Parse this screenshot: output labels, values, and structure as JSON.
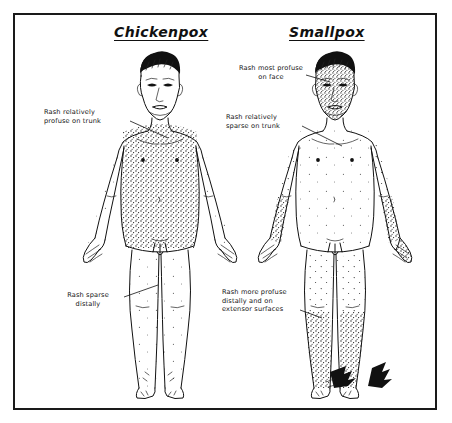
{
  "figure": {
    "caption_type": "medical-comparison-illustration",
    "panels": [
      {
        "id": "chickenpox",
        "title": "Chickenpox",
        "annotations": [
          {
            "id": "cp-trunk",
            "text": "Rash relatively\nprofuse on trunk"
          },
          {
            "id": "cp-distal",
            "text": "Rash sparse\ndistally"
          }
        ]
      },
      {
        "id": "smallpox",
        "title": "Smallpox",
        "annotations": [
          {
            "id": "sp-face",
            "text": "Rash most profuse\non face"
          },
          {
            "id": "sp-trunk",
            "text": "Rash relatively\nsparse on trunk"
          },
          {
            "id": "sp-distal",
            "text": "Rash more profuse\ndistally and on\nextensor surfaces"
          }
        ]
      }
    ]
  },
  "colors": {
    "ink": "#111111",
    "background": "#ffffff",
    "border": "#1a1a1a"
  },
  "diagram_data": {
    "type": "comparative-anatomical-diagram",
    "subject": "Rash distribution comparison between chickenpox and smallpox",
    "figures": 2,
    "rash_density": {
      "chickenpox": {
        "face": "sparse",
        "trunk": "profuse",
        "arms": "sparse",
        "legs": "sparse",
        "distal": "sparse"
      },
      "smallpox": {
        "face": "most profuse",
        "trunk": "sparse",
        "arms": "profuse distally",
        "legs": "profuse distally",
        "distal": "profuse"
      }
    }
  }
}
